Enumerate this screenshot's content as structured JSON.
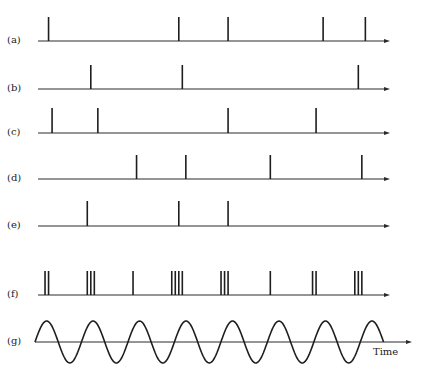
{
  "figure": {
    "time_label": "Time",
    "rows": [
      {
        "id": "a",
        "label": "(a)",
        "spike_times": [
          0.03,
          0.4,
          0.54,
          0.81,
          0.93
        ]
      },
      {
        "id": "b",
        "label": "(b)",
        "spike_times": [
          0.15,
          0.41,
          0.91
        ]
      },
      {
        "id": "c",
        "label": "(c)",
        "spike_times": [
          0.04,
          0.17,
          0.54,
          0.79
        ]
      },
      {
        "id": "d",
        "label": "(d)",
        "spike_times": [
          0.28,
          0.42,
          0.66,
          0.92
        ]
      },
      {
        "id": "e",
        "label": "(e)",
        "spike_times": [
          0.14,
          0.4,
          0.54
        ]
      },
      {
        "id": "f",
        "label": "(f)",
        "spike_times": [
          0.02,
          0.03,
          0.14,
          0.15,
          0.16,
          0.27,
          0.38,
          0.39,
          0.4,
          0.41,
          0.52,
          0.53,
          0.54,
          0.66,
          0.78,
          0.79,
          0.9,
          0.91,
          0.92
        ]
      }
    ],
    "oscillation": {
      "id": "g",
      "label": "(g)",
      "cycles": 8,
      "end_fraction": 0.955
    }
  }
}
